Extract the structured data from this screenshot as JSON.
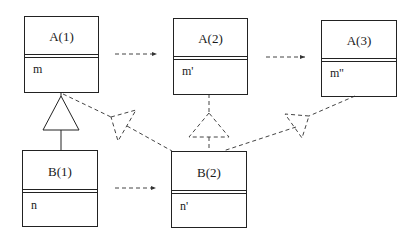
{
  "diagram": {
    "type": "uml-class-evolution",
    "classes": [
      {
        "id": "A1",
        "name": "A(1)",
        "attribute": "m"
      },
      {
        "id": "A2",
        "name": "A(2)",
        "attribute": "m'"
      },
      {
        "id": "A3",
        "name": "A(3)",
        "attribute": "m''"
      },
      {
        "id": "B1",
        "name": "B(1)",
        "attribute": "n"
      },
      {
        "id": "B2",
        "name": "B(2)",
        "attribute": "n'"
      }
    ],
    "relations": [
      {
        "from": "A1",
        "to": "A2",
        "style": "dashed-arrow"
      },
      {
        "from": "A2",
        "to": "A3",
        "style": "dashed-arrow"
      },
      {
        "from": "B1",
        "to": "B2",
        "style": "dashed-arrow"
      },
      {
        "from": "B1",
        "to": "A1",
        "style": "solid-generalization"
      },
      {
        "from": "B2",
        "to": "A1",
        "style": "dashed-generalization"
      },
      {
        "from": "B2",
        "to": "A2",
        "style": "dashed-generalization"
      },
      {
        "from": "B2",
        "to": "A3",
        "style": "dashed-generalization"
      }
    ],
    "colors": {
      "line": "#222222",
      "dashed": "#444444",
      "background": "#ffffff"
    }
  }
}
